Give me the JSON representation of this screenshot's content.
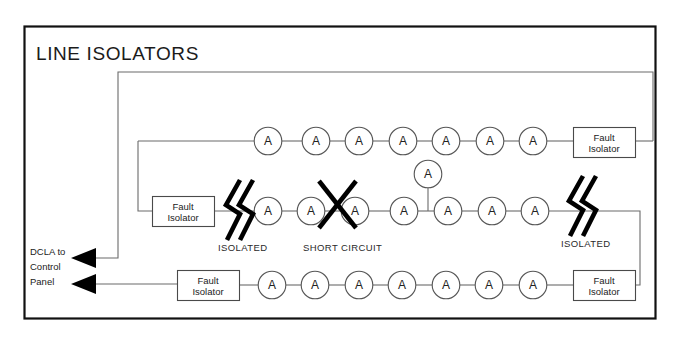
{
  "diagram": {
    "title": "LINE ISOLATORS",
    "frame": {
      "x": 24,
      "y": 26,
      "w": 631,
      "h": 292
    },
    "device_label": "A",
    "isolator_label_line1": "Fault",
    "isolator_label_line2": "Isolator",
    "panel_label_lines": [
      "DCLA to",
      "Control",
      "Panel"
    ],
    "annotations": {
      "isolated_left": "ISOLATED",
      "isolated_right": "ISOLATED",
      "short_circuit": "SHORT CIRCUIT"
    },
    "colors": {
      "frame": "#111111",
      "wire": "#6b6b6b",
      "device_stroke": "#555555",
      "box_stroke": "#4a4a4a",
      "text": "#222222",
      "marker": "#000000",
      "background": "#ffffff"
    },
    "rows": [
      {
        "name": "top-row",
        "y": 141,
        "devices": 7,
        "device_x": [
          268,
          316,
          359,
          403,
          446,
          490,
          533
        ],
        "isolators": [
          {
            "id": "top-right-isolator",
            "x": 573,
            "y": 127,
            "w": 62,
            "h": 30
          }
        ],
        "markers": []
      },
      {
        "name": "middle-row",
        "y": 211,
        "devices": 7,
        "device_x": [
          268,
          311,
          355,
          404,
          448,
          492,
          535
        ],
        "branch_device": {
          "x": 428,
          "y": 174
        },
        "isolators": [
          {
            "id": "middle-left-isolator",
            "x": 152,
            "y": 196,
            "w": 62,
            "h": 30
          }
        ],
        "markers": [
          {
            "type": "isolated",
            "x": 238,
            "y": 211,
            "label": "ISOLATED"
          },
          {
            "type": "short-circuit",
            "x": 337,
            "y": 204,
            "label": "SHORT CIRCUIT"
          },
          {
            "type": "isolated",
            "x": 580,
            "y": 207,
            "label": "ISOLATED"
          }
        ]
      },
      {
        "name": "bottom-row",
        "y": 285,
        "devices": 7,
        "device_x": [
          272,
          315,
          359,
          402,
          446,
          489,
          533
        ],
        "isolators": [
          {
            "id": "bottom-left-isolator",
            "x": 177,
            "y": 270,
            "w": 62,
            "h": 30
          },
          {
            "id": "bottom-right-isolator",
            "x": 573,
            "y": 270,
            "w": 62,
            "h": 30
          }
        ],
        "markers": []
      }
    ],
    "arrows": [
      {
        "id": "dcla-arrow-upper",
        "x": 83,
        "y": 258
      },
      {
        "id": "dcla-arrow-lower",
        "x": 83,
        "y": 284
      }
    ]
  }
}
